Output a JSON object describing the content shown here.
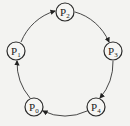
{
  "diagram": {
    "type": "ring",
    "colors": {
      "background": "#f3f3f1",
      "stroke": "#2a2a2a"
    },
    "nodes": [
      {
        "id": "P0",
        "label": "P",
        "sub": "0",
        "x": 34,
        "y": 107
      },
      {
        "id": "P1",
        "label": "P",
        "sub": "1",
        "x": 16,
        "y": 51
      },
      {
        "id": "P2",
        "label": "P",
        "sub": "2",
        "x": 65,
        "y": 12
      },
      {
        "id": "P3",
        "label": "P",
        "sub": "3",
        "x": 113,
        "y": 51
      },
      {
        "id": "P4",
        "label": "P",
        "sub": "4",
        "x": 96,
        "y": 107
      }
    ],
    "edges": [
      {
        "from": "P0",
        "to": "P1"
      },
      {
        "from": "P1",
        "to": "P2"
      },
      {
        "from": "P2",
        "to": "P3"
      },
      {
        "from": "P3",
        "to": "P4"
      },
      {
        "from": "P4",
        "to": "P0"
      }
    ]
  }
}
